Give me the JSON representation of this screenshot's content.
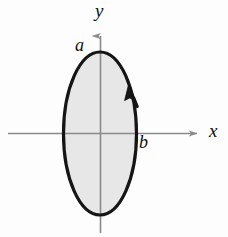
{
  "figure": {
    "kind": "math-diagram",
    "background_color": "#fdfdfd",
    "axes": {
      "x_axis": {
        "label": "x",
        "color": "#8a8a8a",
        "arrow": "right"
      },
      "y_axis": {
        "label": "y",
        "color": "#8a8a8a",
        "arrow": "up"
      }
    },
    "curve": {
      "name": "ellipse",
      "stroke_color": "#151515",
      "fill_color": "#e6e6e6",
      "orientation": "counterclockwise",
      "semi_axis_vertical_label": "a",
      "semi_axis_horizontal_label": "b",
      "center": [
        100,
        133
      ],
      "radius_x": 37,
      "radius_y": 82
    },
    "labels": {
      "y": "y",
      "x": "x",
      "a": "a",
      "b": "b"
    }
  }
}
